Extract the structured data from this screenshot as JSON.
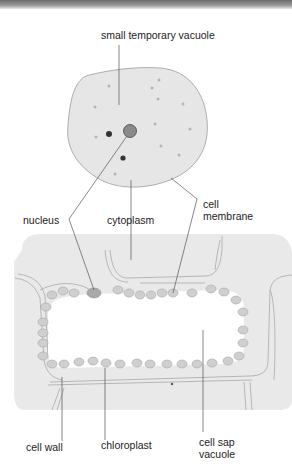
{
  "figure": {
    "type": "labelled biology diagram",
    "colors": {
      "cytoplasm_fill": "#e6e6e6",
      "outline": "#999999",
      "label_line": "#555555",
      "nucleus_fill": "#8a8a8a",
      "dark_granule": "#3a3a3a",
      "chloroplast_fill": "#d0d0d0",
      "vacuole_fill": "#ffffff"
    }
  },
  "labels": {
    "small_temporary_vacuole": "small temporary vacuole",
    "nucleus": "nucleus",
    "cytoplasm": "cytoplasm",
    "cell_membrane_line1": "cell",
    "cell_membrane_line2": "membrane",
    "cell_wall": "cell wall",
    "chloroplast": "chloroplast",
    "cell_sap_vacuole_line1": "cell sap",
    "cell_sap_vacuole_line2": "vacuole"
  }
}
